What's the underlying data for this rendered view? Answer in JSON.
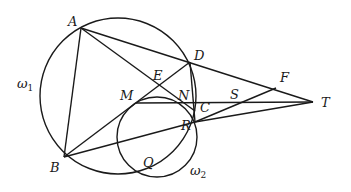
{
  "diagram": {
    "type": "geometry",
    "circles": [
      {
        "name": "omega1",
        "label": "ω",
        "subscript": "1",
        "cx": 118,
        "cy": 96,
        "r": 78
      },
      {
        "name": "omega2",
        "label": "ω",
        "subscript": "2",
        "cx": 157,
        "cy": 137,
        "r": 40
      }
    ],
    "points": {
      "A": {
        "label": "A",
        "x": 81,
        "y": 28
      },
      "B": {
        "label": "B",
        "x": 64,
        "y": 157
      },
      "D": {
        "label": "D",
        "x": 190,
        "y": 62
      },
      "E": {
        "label": "E",
        "x": 157,
        "y": 84
      },
      "M": {
        "label": "M",
        "x": 136,
        "y": 103
      },
      "N": {
        "label": "N",
        "x": 183,
        "y": 103
      },
      "C": {
        "label": "C",
        "x": 195,
        "y": 111
      },
      "R": {
        "label": "R",
        "x": 195,
        "y": 122
      },
      "S": {
        "label": "S",
        "x": 233,
        "y": 103
      },
      "F": {
        "label": "F",
        "x": 276,
        "y": 88
      },
      "T": {
        "label": "T",
        "x": 313,
        "y": 102
      },
      "Q": {
        "label": "Q",
        "x": 150,
        "y": 173
      }
    },
    "segments": [
      [
        "A",
        "B"
      ],
      [
        "A",
        "T"
      ],
      [
        "A",
        "C"
      ],
      [
        "B",
        "D"
      ],
      [
        "B",
        "R"
      ],
      [
        "D",
        "R"
      ],
      [
        "M",
        "T"
      ],
      [
        "R",
        "F"
      ],
      [
        "R",
        "T"
      ]
    ]
  }
}
